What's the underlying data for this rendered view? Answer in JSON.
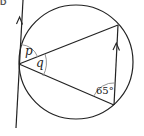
{
  "question": {
    "label": "D"
  },
  "diagram": {
    "type": "circle-theorem",
    "circle": {
      "cx": 76,
      "cy": 62,
      "r": 57
    },
    "tangent_line": {
      "x1": 23,
      "y1": 0,
      "x2": 16,
      "y2": 128
    },
    "vertices": {
      "tangent_point": {
        "x": 19,
        "y": 64
      },
      "top_right": {
        "x": 118,
        "y": 25
      },
      "bottom_right": {
        "x": 114,
        "y": 105
      }
    },
    "angles": {
      "p": "p",
      "q": "q",
      "given": "65°"
    },
    "parallel_marks": [
      "tangent-arrow",
      "chord-arrow"
    ],
    "colors": {
      "stroke": "#222222",
      "arc": "#888888"
    }
  }
}
